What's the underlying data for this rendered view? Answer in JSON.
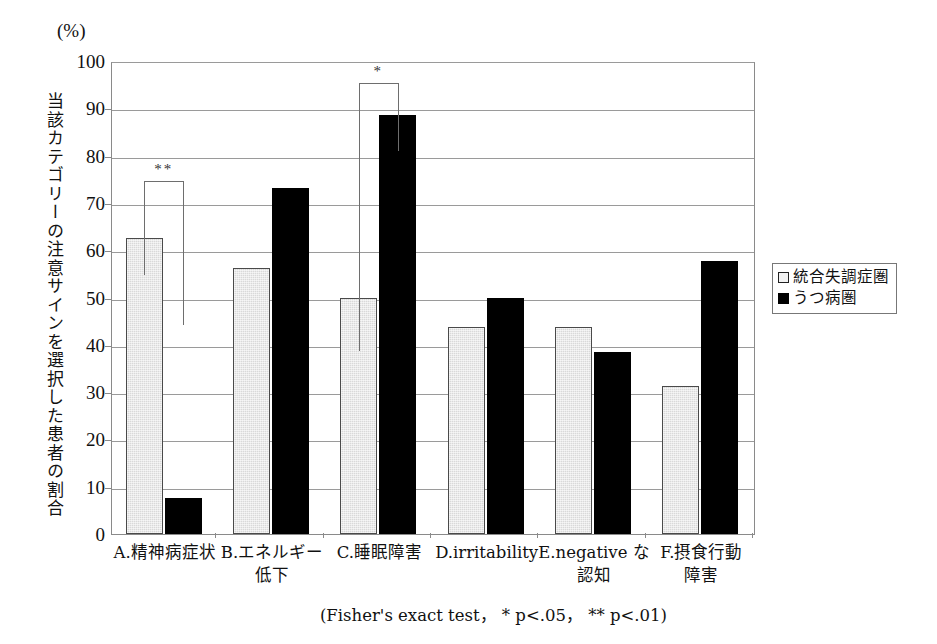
{
  "figure": {
    "unit_label": "(%)",
    "y_axis_title": "当該カテゴリーの注意サインを選択した患者の割合",
    "caption": "(Fisher's exact test， * p<.05， ** p<.01)"
  },
  "legend": {
    "position": "right-middle",
    "entries": [
      {
        "label": "統合失調症圏",
        "swatch": "light-square-icon",
        "color": "#f2f2f2"
      },
      {
        "label": "うつ病圏",
        "swatch": "black-square-icon",
        "color": "#000000"
      }
    ]
  },
  "annotations": [
    {
      "id": "sig-a",
      "stars": "**",
      "group": "A",
      "note": "p<.01"
    },
    {
      "id": "sig-c",
      "stars": "*",
      "group": "C",
      "note": "p<.05"
    }
  ],
  "chart_data": {
    "type": "bar",
    "title": "",
    "xlabel": "",
    "ylabel": "当該カテゴリーの注意サインを選択した患者の割合",
    "yunit": "(%)",
    "ylim": [
      0,
      100
    ],
    "yticks": [
      0,
      10,
      20,
      30,
      40,
      50,
      60,
      70,
      80,
      90,
      100
    ],
    "ytick_labels": [
      "0",
      "10",
      "20",
      "30",
      "40",
      "50",
      "60",
      "70",
      "80",
      "90",
      "100"
    ],
    "grid": true,
    "categories": [
      "A.精神病症状",
      "B.エネルギー\n低下",
      "C.睡眠障害",
      "D.irritability",
      "E.negative な\n認知",
      "F.摂食行動\n障害"
    ],
    "series": [
      {
        "name": "統合失調症圏",
        "color": "#d9d9d9",
        "values": [
          62.5,
          56.3,
          50.0,
          43.8,
          43.8,
          31.3
        ]
      },
      {
        "name": "うつ病圏",
        "color": "#000000",
        "values": [
          7.7,
          73.1,
          88.5,
          50.0,
          38.5,
          57.7
        ]
      }
    ],
    "significance": [
      {
        "categories": "A.精神病症状",
        "marker": "**",
        "p": "p<.01"
      },
      {
        "categories": "C.睡眠障害",
        "marker": "*",
        "p": "p<.05"
      }
    ],
    "test": "Fisher's exact test"
  }
}
